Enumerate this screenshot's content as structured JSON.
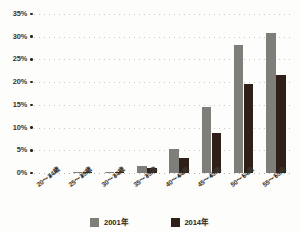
{
  "chart_data": {
    "type": "bar",
    "title": "",
    "xlabel": "",
    "ylabel": "",
    "ylim": [
      0,
      35
    ],
    "ytick_values": [
      35,
      30,
      25,
      20,
      15,
      10,
      5,
      0
    ],
    "ytick_labels": [
      "35%",
      "30%",
      "25%",
      "20%",
      "15%",
      "10%",
      "5%",
      "0%"
    ],
    "grid": true,
    "legend_position": "bottom",
    "categories": [
      "20～24歳",
      "25～29歳",
      "30～34歳",
      "35～39歳",
      "40～44歳",
      "45～49歳",
      "50～54歳",
      "55～59歳"
    ],
    "series": [
      {
        "name": "2001年",
        "color": "#807e78",
        "values": [
          0,
          0.2,
          0.2,
          1.5,
          5.2,
          14.5,
          28.2,
          30.8
        ]
      },
      {
        "name": "2014年",
        "color": "#2e2018",
        "values": [
          0,
          0.2,
          0.3,
          1.0,
          3.3,
          8.8,
          19.6,
          21.6
        ]
      }
    ]
  },
  "legend": {
    "items": [
      {
        "label": "2001年"
      },
      {
        "label": "2014年"
      }
    ]
  },
  "colors": {
    "series_2001": "#807e78",
    "series_2014": "#2e2018",
    "gridline": "#cfc9bd",
    "axis_text": "#3b332c",
    "background": "#fdfdfb"
  }
}
